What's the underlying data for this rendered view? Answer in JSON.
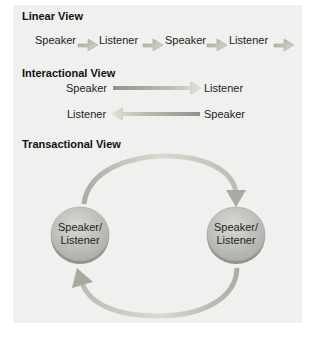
{
  "linear_view": {
    "title": "Linear View",
    "sequence": [
      "Speaker",
      "Listener",
      "Speaker",
      "Listener"
    ],
    "arrow_count": 4
  },
  "interactional_view": {
    "title": "Interactional View",
    "rows": [
      {
        "left": "Speaker",
        "right": "Listener",
        "direction": "right"
      },
      {
        "left": "Listener",
        "right": "Speaker",
        "direction": "left"
      }
    ]
  },
  "transactional_view": {
    "title": "Transactional View",
    "nodes": [
      {
        "line1": "Speaker/",
        "line2": "Listener"
      },
      {
        "line1": "Speaker/",
        "line2": "Listener"
      }
    ],
    "flow": "circular"
  },
  "colors": {
    "background": "#f0f0ef",
    "arrow_light": "#d8dccd",
    "arrow_dark": "#8c9488",
    "disc_fill": "#c4c7c2",
    "disc_edge": "#9a9d98",
    "text": "#222222"
  }
}
